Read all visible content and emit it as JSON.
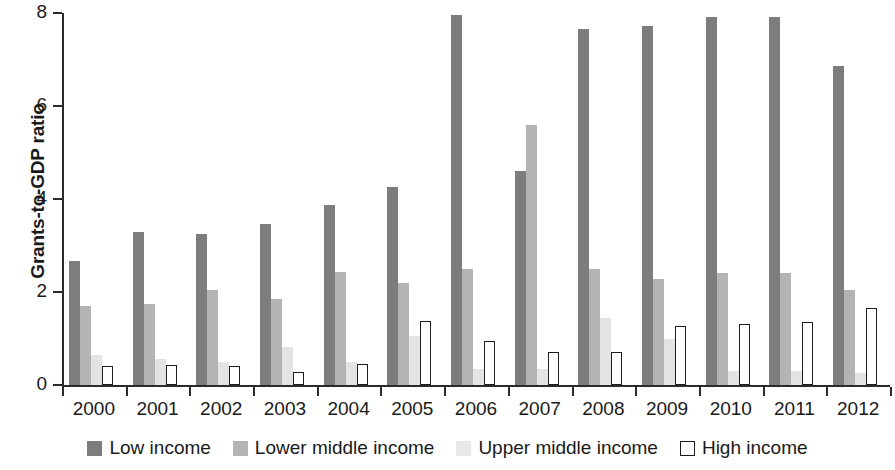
{
  "chart_data": {
    "type": "bar",
    "title": "",
    "subtitle": "",
    "xlabel": "",
    "ylabel": "Grants-to-GDP ratio",
    "ylim": [
      0,
      8
    ],
    "y_ticks": [
      0,
      2,
      4,
      6,
      8
    ],
    "y_tick_labels": [
      "0",
      "2",
      "4",
      "6",
      "8"
    ],
    "grid": false,
    "legend_position": "bottom",
    "categories": [
      "2000",
      "2001",
      "2002",
      "2003",
      "2004",
      "2005",
      "2006",
      "2007",
      "2008",
      "2009",
      "2010",
      "2011",
      "2012"
    ],
    "series": [
      {
        "name": "Low income",
        "color": "#7d7d7d",
        "values": [
          2.67,
          3.3,
          3.25,
          3.47,
          3.87,
          4.25,
          7.95,
          4.6,
          7.65,
          7.72,
          7.92,
          7.92,
          6.85
        ]
      },
      {
        "name": "Lower middle income",
        "color": "#b4b4b4",
        "values": [
          1.7,
          1.75,
          2.05,
          1.85,
          2.43,
          2.2,
          2.5,
          5.6,
          2.5,
          2.27,
          2.4,
          2.4,
          2.05
        ]
      },
      {
        "name": "Upper middle income",
        "color": "#e4e4e4",
        "values": [
          0.65,
          0.55,
          0.5,
          0.82,
          0.5,
          1.05,
          0.35,
          0.35,
          1.45,
          1.0,
          0.3,
          0.3,
          0.25
        ]
      },
      {
        "name": "High income",
        "color": "#ffffff",
        "outline": "#1d1d1d",
        "values": [
          0.4,
          0.42,
          0.4,
          0.28,
          0.45,
          1.37,
          0.95,
          0.72,
          0.72,
          1.27,
          1.32,
          1.35,
          1.65
        ]
      }
    ]
  }
}
